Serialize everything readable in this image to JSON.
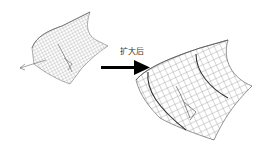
{
  "figure": {
    "caption_label": "扩大后",
    "label_meaning": "after enlargement",
    "arrow": {
      "direction": "right",
      "color": "#000000"
    },
    "surfaces": [
      {
        "name": "original-surface",
        "size": "small",
        "mesh_color": "#888888"
      },
      {
        "name": "enlarged-surface",
        "size": "large",
        "mesh_color": "#777777"
      }
    ]
  }
}
